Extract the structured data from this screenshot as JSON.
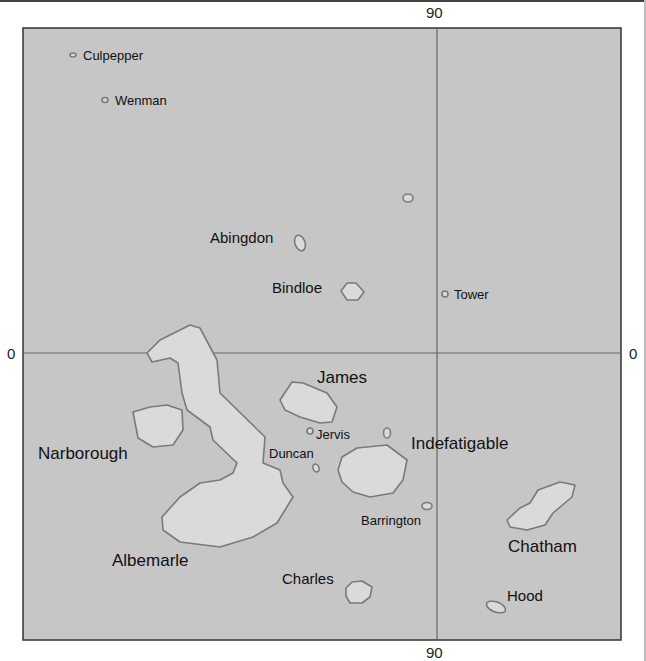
{
  "map": {
    "title": "Galápagos Islands",
    "colors": {
      "sea": "#c6c6c6",
      "land": "#dadada",
      "coast": "#7a7a7a",
      "grid": "#666666",
      "frame": "#333333"
    },
    "axis_labels": {
      "top": "90",
      "bottom": "90",
      "left": "0",
      "right": "0"
    },
    "islands": [
      {
        "name": "Culpepper",
        "label": "Culpepper"
      },
      {
        "name": "Wenman",
        "label": "Wenman"
      },
      {
        "name": "Abingdon",
        "label": "Abingdon"
      },
      {
        "name": "Bindloe",
        "label": "Bindloe"
      },
      {
        "name": "Tower",
        "label": "Tower"
      },
      {
        "name": "James",
        "label": "James"
      },
      {
        "name": "Jervis",
        "label": "Jervis"
      },
      {
        "name": "Duncan",
        "label": "Duncan"
      },
      {
        "name": "Indefatigable",
        "label": "Indefatigable"
      },
      {
        "name": "Narborough",
        "label": "Narborough"
      },
      {
        "name": "Albemarle",
        "label": "Albemarle"
      },
      {
        "name": "Barrington",
        "label": "Barrington"
      },
      {
        "name": "Chatham",
        "label": "Chatham"
      },
      {
        "name": "Charles",
        "label": "Charles"
      },
      {
        "name": "Hood",
        "label": "Hood"
      }
    ]
  }
}
